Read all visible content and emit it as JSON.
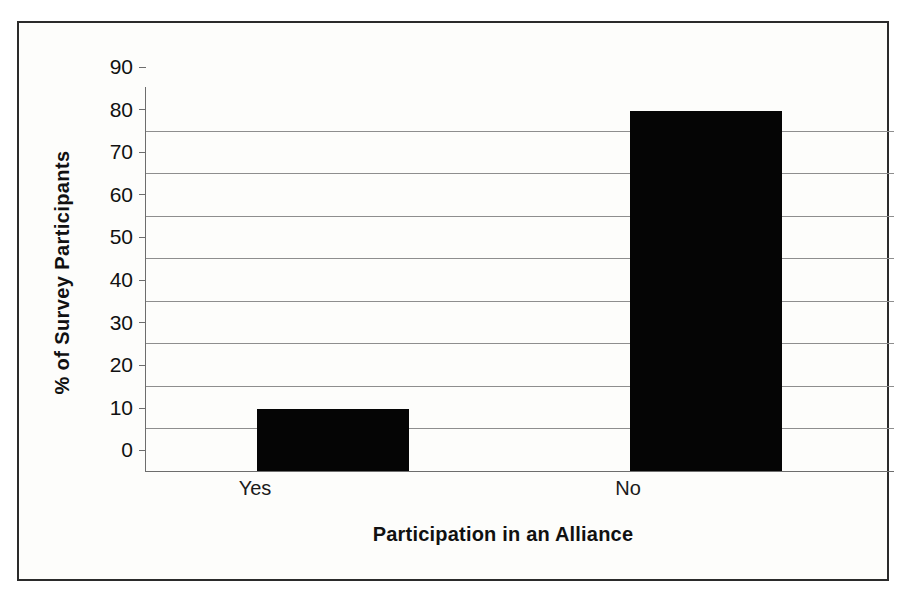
{
  "chart_data": {
    "type": "bar",
    "title": "",
    "categories": [
      "Yes",
      "No"
    ],
    "values": [
      14.5,
      84.5
    ],
    "xlabel": "Participation in an Alliance",
    "ylabel": "% of Survey Participants",
    "ylim": [
      0,
      90
    ],
    "ytick_labels": [
      "90",
      "80",
      "70",
      "60",
      "50",
      "40",
      "30",
      "20",
      "10",
      "0"
    ],
    "ytick_values": [
      90,
      80,
      70,
      60,
      50,
      40,
      30,
      20,
      10,
      0
    ],
    "grid": "horizontal",
    "legend": "none",
    "bar_color": "#050505",
    "gridline_color": "#8e8e8e",
    "axis_color": "#6d6d6d",
    "frame_color": "#2b2b2b",
    "background_color": "#fdfdfb"
  }
}
